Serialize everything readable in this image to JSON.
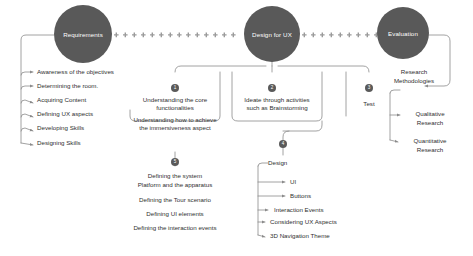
{
  "diagram": {
    "accent_color": "#595959",
    "line_color": "#8a8a8a",
    "text_color": "#2f2f2f",
    "phases": [
      {
        "id": "requirements",
        "label": "Requirements"
      },
      {
        "id": "design-for-ux",
        "label": "Design for UX"
      },
      {
        "id": "evaluation",
        "label": "Evaluation"
      }
    ],
    "requirements_items": [
      "Awareness of the objectives",
      "Determining the room.",
      "Acquiring Content",
      "Defining UX aspects",
      "Developing Skills",
      "Designing Skills"
    ],
    "branch_one": {
      "badge": "1",
      "lines": [
        "Understanding the core",
        "functionalities",
        "Understanding how to achieve",
        "the immersiveness aspect"
      ]
    },
    "branch_two": {
      "badge": "2",
      "lines": [
        "Ideate through activities",
        "such as Brainstorming"
      ]
    },
    "branch_three": {
      "badge": "3",
      "lines": [
        "Test"
      ]
    },
    "branch_system": {
      "badge": "5",
      "items": [
        "Defining the system",
        "Platform and the apparatus",
        "Defining the Tour scenario",
        "Defining UI elements",
        "Defining the interaction events"
      ]
    },
    "branch_design": {
      "badge": "4",
      "label": "Design",
      "items": [
        "UI",
        "Buttons",
        "Interaction Events",
        "Considering UX Aspects",
        "3D Navigation Theme"
      ]
    },
    "evaluation_branch": {
      "root": [
        "Research",
        "Methodologies"
      ],
      "items": [
        [
          "Qualitative",
          "Research"
        ],
        [
          "Quantitative",
          "Research"
        ]
      ]
    }
  }
}
